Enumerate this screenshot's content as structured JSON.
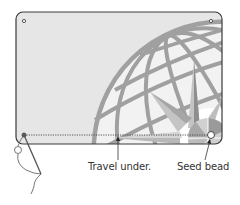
{
  "diagram": {
    "type": "beading-instruction",
    "labels": {
      "travel_under": "Travel under.",
      "seed_bead": "Seed bead"
    },
    "colors": {
      "card_fill": "#e6e6e6",
      "card_border": "#3a3a3a",
      "globe": "#9a9a9a",
      "compass_light": "#c4c4c4",
      "compass_dark": "#8e8e8e",
      "thread": "#555555",
      "text": "#333333"
    }
  }
}
